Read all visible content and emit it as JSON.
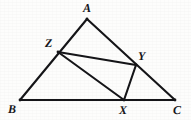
{
  "figure": {
    "type": "geometry-diagram",
    "canvas": {
      "width": 191,
      "height": 120
    },
    "stroke_color": "#151518",
    "background_color": "#fdfdfc",
    "stroke_width": 2.1,
    "points": [
      {
        "id": "A",
        "label": "A",
        "x": 87,
        "y": 19,
        "label_x": 83,
        "label_y": 2
      },
      {
        "id": "B",
        "label": "B",
        "x": 20,
        "y": 100,
        "label_x": 8,
        "label_y": 103
      },
      {
        "id": "C",
        "label": "C",
        "x": 175,
        "y": 100,
        "label_x": 173,
        "label_y": 104
      },
      {
        "id": "Z",
        "label": "Z",
        "x": 58,
        "y": 52,
        "label_x": 45,
        "label_y": 37
      },
      {
        "id": "Y",
        "label": "Y",
        "x": 136,
        "y": 65,
        "label_x": 138,
        "label_y": 50
      },
      {
        "id": "X",
        "label": "X",
        "x": 124,
        "y": 100,
        "label_x": 119,
        "label_y": 104
      }
    ],
    "segments": [
      {
        "id": "AB",
        "from": "A",
        "to": "B",
        "x1": 87,
        "y1": 19,
        "x2": 20,
        "y2": 100
      },
      {
        "id": "AC",
        "from": "A",
        "to": "C",
        "x1": 87,
        "y1": 19,
        "x2": 175,
        "y2": 100
      },
      {
        "id": "BC",
        "from": "B",
        "to": "C",
        "x1": 20,
        "y1": 100,
        "x2": 175,
        "y2": 100
      },
      {
        "id": "ZY",
        "from": "Z",
        "to": "Y",
        "x1": 58,
        "y1": 52,
        "x2": 136,
        "y2": 65
      },
      {
        "id": "ZX",
        "from": "Z",
        "to": "X",
        "x1": 58,
        "y1": 52,
        "x2": 124,
        "y2": 100
      },
      {
        "id": "XY",
        "from": "X",
        "to": "Y",
        "x1": 124,
        "y1": 100,
        "x2": 136,
        "y2": 65
      }
    ]
  }
}
